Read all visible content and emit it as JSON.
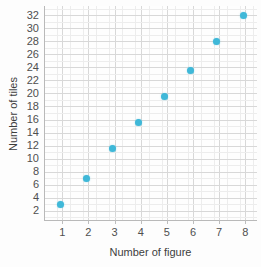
{
  "chart_data": {
    "type": "scatter",
    "title": "",
    "xlabel": "Number of figure",
    "ylabel": "Number of tiles",
    "x": [
      1,
      2,
      3,
      4,
      5,
      6,
      7,
      8
    ],
    "values": [
      3,
      7,
      11.5,
      15.5,
      19.5,
      23.5,
      28,
      32
    ],
    "points": [
      {
        "x": 1,
        "y": 3
      },
      {
        "x": 2,
        "y": 7
      },
      {
        "x": 3,
        "y": 11.5
      },
      {
        "x": 4,
        "y": 15.5
      },
      {
        "x": 5,
        "y": 19.5
      },
      {
        "x": 6,
        "y": 23.5
      },
      {
        "x": 7,
        "y": 28
      },
      {
        "x": 8,
        "y": 32
      }
    ],
    "xlim": [
      0.3,
      8.45
    ],
    "ylim": [
      0.6,
      33.4
    ],
    "xticks": [
      1,
      2,
      3,
      4,
      5,
      6,
      7,
      8
    ],
    "yticks": [
      2,
      4,
      6,
      8,
      10,
      12,
      14,
      16,
      18,
      20,
      22,
      24,
      26,
      28,
      30,
      32
    ],
    "xtick_labels": [
      "1",
      "2",
      "3",
      "4",
      "5",
      "6",
      "7",
      "8"
    ],
    "ytick_labels": [
      "2",
      "4",
      "6",
      "8",
      "10",
      "12",
      "14",
      "16",
      "18",
      "20",
      "22",
      "24",
      "26",
      "28",
      "30",
      "32"
    ],
    "grid": true,
    "minor_grid": true,
    "legend": null,
    "marker_color": "#3fb8d8",
    "grid_color": "#d8d8d8",
    "minor_grid_color": "#ededed",
    "axis_color": "#b9b9b9",
    "background_color": "#fefefe",
    "text_color": "#4f4f4f"
  }
}
